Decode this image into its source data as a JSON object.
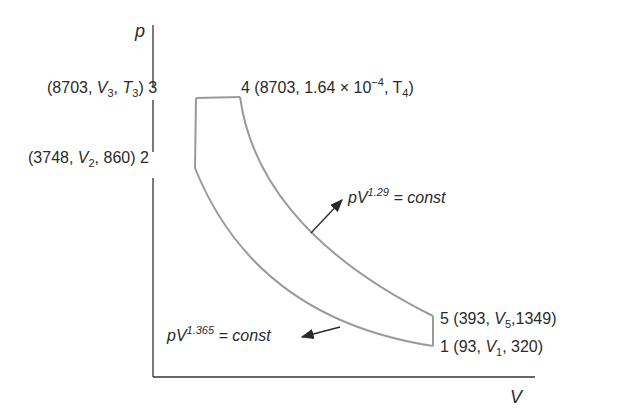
{
  "axes": {
    "y_label": "p",
    "x_label": "V"
  },
  "points": {
    "p3": {
      "number": "3",
      "pressure": "8703",
      "volume": "V",
      "volume_sub": "3",
      "temp": "T",
      "temp_sub": "3"
    },
    "p4": {
      "number": "4",
      "pressure": "8703",
      "volume": "1.64 × 10",
      "volume_exp": "−4",
      "temp": "T",
      "temp_sub": "4"
    },
    "p2": {
      "number": "2",
      "pressure": "3748",
      "volume": "V",
      "volume_sub": "2",
      "temp": "860"
    },
    "p5": {
      "number": "5",
      "pressure": "393",
      "volume": "V",
      "volume_sub": "5",
      "temp": "1349"
    },
    "p1": {
      "number": "1",
      "pressure": "93",
      "volume": "V",
      "volume_sub": "1",
      "temp": "320"
    }
  },
  "annotations": {
    "expansion": {
      "base": "pV",
      "exponent": "1.29",
      "rhs": "= const"
    },
    "compression": {
      "base": "pV",
      "exponent": "1.365",
      "rhs": "= const"
    }
  },
  "colors": {
    "cycle_line": "#9a9a9a",
    "axis_line": "#333333",
    "text": "#2a2a2a"
  }
}
